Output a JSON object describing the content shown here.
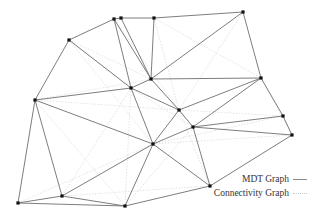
{
  "diagram": {
    "title": "",
    "nodes": [
      {
        "id": 0,
        "x": 69,
        "y": 40
      },
      {
        "id": 1,
        "x": 114,
        "y": 19
      },
      {
        "id": 2,
        "x": 121,
        "y": 18
      },
      {
        "id": 3,
        "x": 154,
        "y": 18
      },
      {
        "id": 4,
        "x": 243,
        "y": 12
      },
      {
        "id": 5,
        "x": 131,
        "y": 88
      },
      {
        "id": 6,
        "x": 151,
        "y": 79
      },
      {
        "id": 7,
        "x": 179,
        "y": 110
      },
      {
        "id": 8,
        "x": 261,
        "y": 78
      },
      {
        "id": 9,
        "x": 35,
        "y": 100
      },
      {
        "id": 10,
        "x": 193,
        "y": 127
      },
      {
        "id": 11,
        "x": 283,
        "y": 116
      },
      {
        "id": 12,
        "x": 292,
        "y": 135
      },
      {
        "id": 13,
        "x": 153,
        "y": 144
      },
      {
        "id": 14,
        "x": 210,
        "y": 186
      },
      {
        "id": 15,
        "x": 18,
        "y": 203
      },
      {
        "id": 16,
        "x": 62,
        "y": 196
      },
      {
        "id": 17,
        "x": 125,
        "y": 206
      }
    ],
    "mdt_edges": [
      [
        0,
        1
      ],
      [
        1,
        2
      ],
      [
        2,
        3
      ],
      [
        3,
        4
      ],
      [
        0,
        9
      ],
      [
        0,
        5
      ],
      [
        1,
        5
      ],
      [
        1,
        6
      ],
      [
        2,
        6
      ],
      [
        3,
        6
      ],
      [
        4,
        6
      ],
      [
        4,
        8
      ],
      [
        6,
        8
      ],
      [
        6,
        7
      ],
      [
        5,
        7
      ],
      [
        5,
        6
      ],
      [
        7,
        8
      ],
      [
        10,
        8
      ],
      [
        7,
        13
      ],
      [
        13,
        10
      ],
      [
        10,
        11
      ],
      [
        10,
        12
      ],
      [
        10,
        14
      ],
      [
        8,
        11
      ],
      [
        11,
        12
      ],
      [
        12,
        14
      ],
      [
        9,
        5
      ],
      [
        9,
        13
      ],
      [
        9,
        15
      ],
      [
        9,
        16
      ],
      [
        5,
        13
      ],
      [
        13,
        16
      ],
      [
        13,
        17
      ],
      [
        13,
        14
      ],
      [
        17,
        14
      ],
      [
        16,
        17
      ],
      [
        15,
        17
      ],
      [
        15,
        16
      ],
      [
        7,
        10
      ]
    ],
    "connectivity_edges": [
      [
        0,
        5
      ],
      [
        0,
        6
      ],
      [
        9,
        6
      ],
      [
        9,
        7
      ],
      [
        1,
        7
      ],
      [
        3,
        7
      ],
      [
        3,
        8
      ],
      [
        4,
        7
      ],
      [
        6,
        10
      ],
      [
        5,
        10
      ],
      [
        8,
        12
      ],
      [
        7,
        11
      ],
      [
        13,
        11
      ],
      [
        13,
        12
      ],
      [
        10,
        17
      ],
      [
        7,
        14
      ],
      [
        9,
        17
      ],
      [
        15,
        13
      ],
      [
        16,
        14
      ],
      [
        5,
        16
      ],
      [
        5,
        17
      ],
      [
        0,
        13
      ]
    ]
  },
  "legend": {
    "items": [
      {
        "label": "MDT Graph",
        "style": "solid"
      },
      {
        "label": "Connectivity Graph",
        "style": "dotted"
      }
    ]
  },
  "colors": {
    "mdt_edge": "#6e6e6e",
    "connectivity_edge": "#dcdcdc",
    "node": "#111111",
    "background": "#ffffff"
  }
}
